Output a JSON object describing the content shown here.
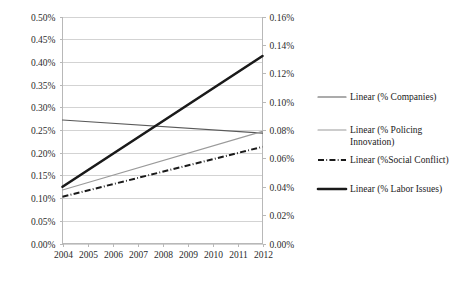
{
  "chart_data": {
    "type": "line",
    "title": "",
    "xlabel": "",
    "ylabel": "",
    "grid": true,
    "legend_position": "right",
    "x": [
      2004,
      2005,
      2006,
      2007,
      2008,
      2009,
      2010,
      2011,
      2012
    ],
    "x_tick_labels": [
      "2004",
      "2005",
      "2006",
      "2007",
      "2008",
      "2009",
      "2010",
      "2011",
      "2012"
    ],
    "primary_axis": {
      "name": "left",
      "ylim": [
        0.0,
        0.5
      ],
      "tick_labels": [
        "0.50%",
        "0.45%",
        "0.40%",
        "0.35%",
        "0.30%",
        "0.25%",
        "0.20%",
        "0.15%",
        "0.10%",
        "0.05%",
        "0.00%"
      ],
      "tick_values": [
        0.5,
        0.45,
        0.4,
        0.35,
        0.3,
        0.25,
        0.2,
        0.15,
        0.1,
        0.05,
        0.0
      ]
    },
    "secondary_axis": {
      "name": "right",
      "ylim": [
        0.0,
        0.16
      ],
      "tick_labels": [
        "0.16%",
        "0.14%",
        "0.12%",
        "0.10%",
        "0.08%",
        "0.06%",
        "0.04%",
        "0.02%",
        "0.00%"
      ],
      "tick_values": [
        0.16,
        0.14,
        0.12,
        0.1,
        0.08,
        0.06,
        0.04,
        0.02,
        0.0
      ]
    },
    "series": [
      {
        "name": "Linear (% Companies)",
        "axis": "left",
        "style": "solid-thin-dark",
        "color": "#595959",
        "width": 1.2,
        "x": [
          2004,
          2012
        ],
        "values": [
          0.272,
          0.243
        ]
      },
      {
        "name": "Linear (% Policing Innovation)",
        "axis": "left",
        "style": "solid-thin-light",
        "color": "#9a9a9a",
        "width": 1.1,
        "x": [
          2004,
          2012
        ],
        "values": [
          0.118,
          0.247
        ]
      },
      {
        "name": "Linear (%Social Conflict)",
        "axis": "left",
        "style": "dash-dot",
        "color": "#1a1a1a",
        "width": 2.0,
        "x": [
          2004,
          2012
        ],
        "values": [
          0.103,
          0.213
        ]
      },
      {
        "name": "Linear (% Labor Issues)",
        "axis": "left",
        "style": "solid-thick",
        "color": "#1a1a1a",
        "width": 2.6,
        "x": [
          2004,
          2012
        ],
        "values": [
          0.125,
          0.413
        ]
      }
    ],
    "legend": [
      {
        "label": "Linear (% Companies)",
        "label_line1": "Linear (% Companies)",
        "label_line2": "",
        "style": "solid-thin-dark"
      },
      {
        "label": "Linear (% Policing Innovation)",
        "label_line1": "Linear (% Policing",
        "label_line2": "Innovation)",
        "style": "solid-thin-light"
      },
      {
        "label": "Linear (%Social Conflict)",
        "label_line1": "Linear (%Social Conflict)",
        "label_line2": "",
        "style": "dash-dot"
      },
      {
        "label": "Linear (% Labor Issues)",
        "label_line1": "Linear (% Labor Issues)",
        "label_line2": "",
        "style": "solid-thick"
      }
    ]
  }
}
